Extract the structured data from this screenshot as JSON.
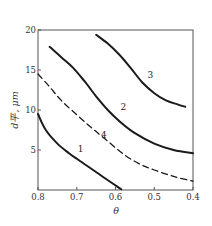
{
  "chart_data": {
    "type": "line",
    "title": "",
    "xlabel": "θ",
    "ylabel": "d平, μm",
    "xlim": [
      0.8,
      0.4
    ],
    "ylim": [
      0,
      20
    ],
    "x_reversed": true,
    "grid": false,
    "legend": "inline curve numbers",
    "xticks": [
      "0.8",
      "0.7",
      "0.6",
      "0.5",
      "0.4"
    ],
    "yticks": [
      "5",
      "10",
      "15",
      "20"
    ],
    "series": [
      {
        "name": "1",
        "style": "solid",
        "points": [
          [
            0.8,
            9.5
          ],
          [
            0.78,
            7.5
          ],
          [
            0.75,
            5.8
          ],
          [
            0.72,
            4.6
          ],
          [
            0.7,
            3.9
          ],
          [
            0.67,
            2.9
          ],
          [
            0.64,
            1.9
          ],
          [
            0.61,
            0.9
          ],
          [
            0.585,
            0.1
          ]
        ]
      },
      {
        "name": "2",
        "style": "solid",
        "points": [
          [
            0.77,
            17.9
          ],
          [
            0.74,
            16.6
          ],
          [
            0.71,
            15.3
          ],
          [
            0.68,
            13.6
          ],
          [
            0.65,
            11.7
          ],
          [
            0.62,
            10.0
          ],
          [
            0.59,
            8.6
          ],
          [
            0.55,
            7.1
          ],
          [
            0.5,
            5.8
          ],
          [
            0.45,
            5.0
          ],
          [
            0.4,
            4.6
          ]
        ]
      },
      {
        "name": "3",
        "style": "solid",
        "points": [
          [
            0.65,
            19.4
          ],
          [
            0.62,
            18.3
          ],
          [
            0.59,
            16.9
          ],
          [
            0.56,
            15.2
          ],
          [
            0.53,
            13.4
          ],
          [
            0.5,
            12.1
          ],
          [
            0.47,
            11.2
          ],
          [
            0.44,
            10.7
          ],
          [
            0.42,
            10.4
          ]
        ]
      },
      {
        "name": "4",
        "style": "dashed",
        "points": [
          [
            0.8,
            14.5
          ],
          [
            0.77,
            12.9
          ],
          [
            0.74,
            11.2
          ],
          [
            0.7,
            9.4
          ],
          [
            0.66,
            7.7
          ],
          [
            0.62,
            6.1
          ],
          [
            0.58,
            4.5
          ],
          [
            0.54,
            3.3
          ],
          [
            0.5,
            2.5
          ],
          [
            0.45,
            1.7
          ],
          [
            0.4,
            1.1
          ]
        ]
      }
    ],
    "curve_labels": [
      {
        "text": "1",
        "x": 0.69,
        "y": 4.8
      },
      {
        "text": "2",
        "x": 0.58,
        "y": 10.0
      },
      {
        "text": "3",
        "x": 0.51,
        "y": 14.0
      },
      {
        "text": "4",
        "x": 0.63,
        "y": 6.5
      }
    ]
  },
  "colors": {
    "line": "#1a1a1a",
    "axis": "#555555",
    "background": "#ffffff"
  }
}
